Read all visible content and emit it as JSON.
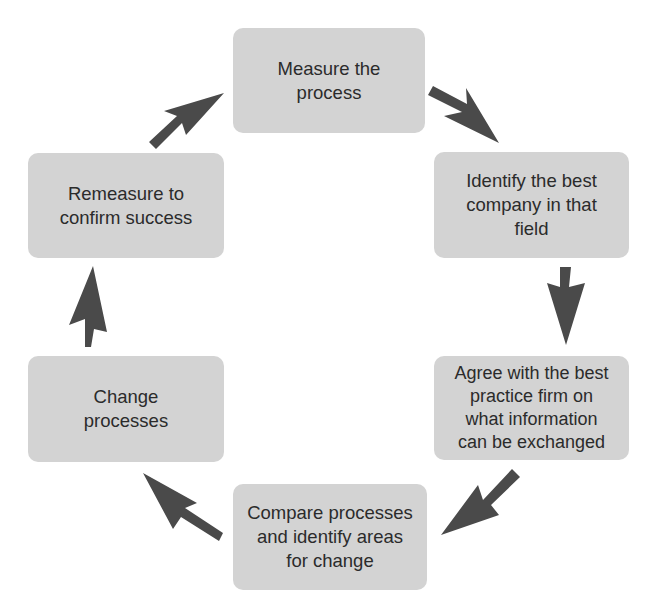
{
  "diagram": {
    "type": "cycle",
    "direction": "clockwise",
    "colors": {
      "box_fill": "#d3d3d3",
      "text": "#2b2b2b",
      "arrow": "#4a4a4a",
      "background": "#ffffff"
    },
    "steps": [
      {
        "id": "step-1",
        "label": "Measure the\nprocess"
      },
      {
        "id": "step-2",
        "label": "Identify the best\ncompany in that\nfield"
      },
      {
        "id": "step-3",
        "label": "Agree with the best\npractice firm on\nwhat information\ncan be exchanged"
      },
      {
        "id": "step-4",
        "label": "Compare processes\nand identify areas\nfor change"
      },
      {
        "id": "step-5",
        "label": "Change\nprocesses"
      },
      {
        "id": "step-6",
        "label": "Remeasure to\nconfirm success"
      }
    ],
    "arrows": [
      {
        "from": "step-1",
        "to": "step-2"
      },
      {
        "from": "step-2",
        "to": "step-3"
      },
      {
        "from": "step-3",
        "to": "step-4"
      },
      {
        "from": "step-4",
        "to": "step-5"
      },
      {
        "from": "step-5",
        "to": "step-6"
      },
      {
        "from": "step-6",
        "to": "step-1"
      }
    ]
  }
}
